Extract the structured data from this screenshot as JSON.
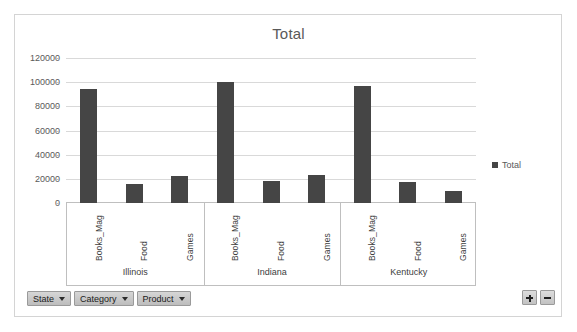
{
  "chart_data": {
    "type": "bar",
    "title": "Total",
    "xlabel": "",
    "ylabel": "",
    "ylim": [
      0,
      120000
    ],
    "ytick_values": [
      0,
      20000,
      40000,
      60000,
      80000,
      100000,
      120000
    ],
    "ytick_labels": [
      "0",
      "20000",
      "40000",
      "60000",
      "80000",
      "100000",
      "120000"
    ],
    "grid": true,
    "legend_position": "right",
    "legend_entries": [
      "Total"
    ],
    "series": [
      {
        "name": "Total",
        "color": "#454545",
        "values": [
          94500,
          15500,
          22000,
          100000,
          18000,
          23500,
          96500,
          17000,
          10000
        ]
      }
    ],
    "categories": [
      "Books_Mag",
      "Food",
      "Games",
      "Books_Mag",
      "Food",
      "Games",
      "Books_Mag",
      "Food",
      "Games"
    ],
    "groups": [
      {
        "label": "Illinois",
        "categories": [
          "Books_Mag",
          "Food",
          "Games"
        ]
      },
      {
        "label": "Indiana",
        "categories": [
          "Books_Mag",
          "Food",
          "Games"
        ]
      },
      {
        "label": "Kentucky",
        "categories": [
          "Books_Mag",
          "Food",
          "Games"
        ]
      }
    ]
  },
  "chart": {
    "title": "Total",
    "legend_label": "Total",
    "bar_color": "#454545",
    "gridline_color": "#d9d9d9",
    "axis_color": "#bfbfbf"
  },
  "field_buttons": [
    {
      "label": "State",
      "icon": "chevron-down-icon"
    },
    {
      "label": "Category",
      "icon": "chevron-down-icon"
    },
    {
      "label": "Product",
      "icon": "chevron-down-icon"
    }
  ],
  "detail_buttons": [
    {
      "name": "expand-field-button",
      "icon": "plus-icon",
      "label": "+"
    },
    {
      "name": "collapse-field-button",
      "icon": "minus-icon",
      "label": "−"
    }
  ]
}
